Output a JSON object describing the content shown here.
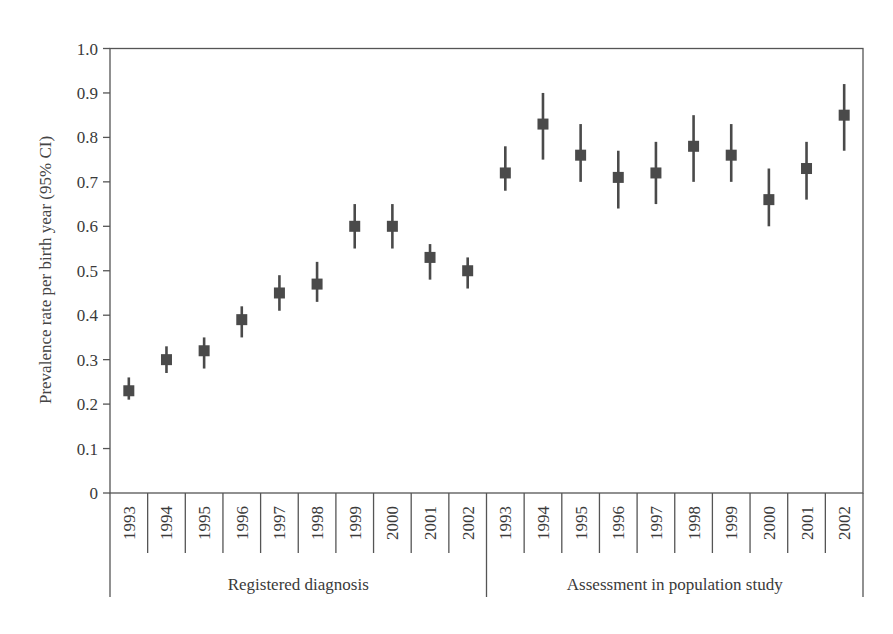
{
  "chart_data": {
    "type": "scatter",
    "subtype": "point-with-error-bars",
    "title": "",
    "ylabel": "Prevalence rate per birth year  (95% CI)",
    "xlabel": "",
    "ylim": [
      0,
      1.0
    ],
    "yticks": [
      0,
      0.1,
      0.2,
      0.3,
      0.4,
      0.5,
      0.6,
      0.7,
      0.8,
      0.9,
      1.0
    ],
    "ytick_labels": [
      "0",
      "0.1",
      "0.2",
      "0.3",
      "0.4",
      "0.5",
      "0.6",
      "0.7",
      "0.8",
      "0.9",
      "1.0"
    ],
    "grid": false,
    "legend": null,
    "groups": [
      {
        "name": "Registered diagnosis",
        "categories": [
          "1993",
          "1994",
          "1995",
          "1996",
          "1997",
          "1998",
          "1999",
          "2000",
          "2001",
          "2002"
        ],
        "values": [
          0.23,
          0.3,
          0.32,
          0.39,
          0.45,
          0.47,
          0.6,
          0.6,
          0.53,
          0.5
        ],
        "ci_low": [
          0.21,
          0.27,
          0.28,
          0.35,
          0.41,
          0.43,
          0.55,
          0.55,
          0.48,
          0.46
        ],
        "ci_high": [
          0.26,
          0.33,
          0.35,
          0.42,
          0.49,
          0.52,
          0.65,
          0.65,
          0.56,
          0.53
        ]
      },
      {
        "name": "Assessment in population study",
        "categories": [
          "1993",
          "1994",
          "1995",
          "1996",
          "1997",
          "1998",
          "1999",
          "2000",
          "2001",
          "2002"
        ],
        "values": [
          0.72,
          0.83,
          0.76,
          0.71,
          0.72,
          0.78,
          0.76,
          0.66,
          0.73,
          0.85
        ],
        "ci_low": [
          0.68,
          0.75,
          0.7,
          0.64,
          0.65,
          0.7,
          0.7,
          0.6,
          0.66,
          0.77
        ],
        "ci_high": [
          0.78,
          0.9,
          0.83,
          0.77,
          0.79,
          0.85,
          0.83,
          0.73,
          0.79,
          0.92
        ]
      }
    ],
    "colors": {
      "marker": "#4a4a4a",
      "axis": "#555555",
      "text": "#3a3a3a"
    }
  }
}
